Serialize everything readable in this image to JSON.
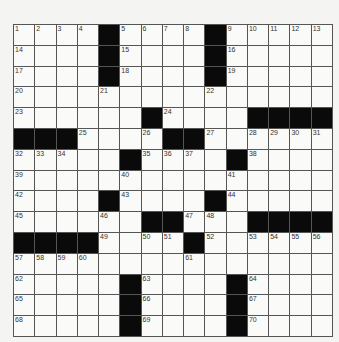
{
  "puzzle": {
    "rows": 15,
    "cols": 15,
    "layout": [
      "....#....#.....",
      "....#....#.....",
      "....#....#.....",
      "...............",
      "......#....####",
      "###....##......",
      ".....#....#....",
      "...............",
      "....#....#.....",
      "......##...####",
      "####....#......",
      "...............",
      ".....#....#....",
      ".....#....#....",
      ".....#....#...."
    ],
    "colors": {
      "black": "#0a0a0a",
      "white": "#fafaf8",
      "line": "#555555"
    }
  }
}
